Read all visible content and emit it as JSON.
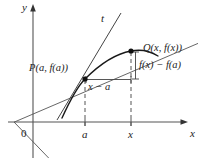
{
  "figure": {
    "type": "math-diagram",
    "axes": {
      "y_label": "y",
      "x_label": "x",
      "origin_label": "0"
    },
    "ticks": {
      "x": [
        {
          "label": "a",
          "position_px": 85
        },
        {
          "label": "x",
          "position_px": 131
        }
      ]
    },
    "points": [
      {
        "name": "P",
        "label": "P(a, f(a))",
        "x_px": 85,
        "y_px": 79
      },
      {
        "name": "Q",
        "label": "Q(x, f(x))",
        "x_px": 131,
        "y_px": 51
      }
    ],
    "lines": [
      {
        "name": "tangent",
        "label": "t"
      },
      {
        "name": "secant",
        "label": ""
      }
    ],
    "annotations": {
      "rise": "f(x) − f(a)",
      "run": "x − a"
    },
    "colors": {
      "stroke": "#333333",
      "curve": "#1a1a1a",
      "dashed": "#555555",
      "text": "#222222"
    }
  }
}
